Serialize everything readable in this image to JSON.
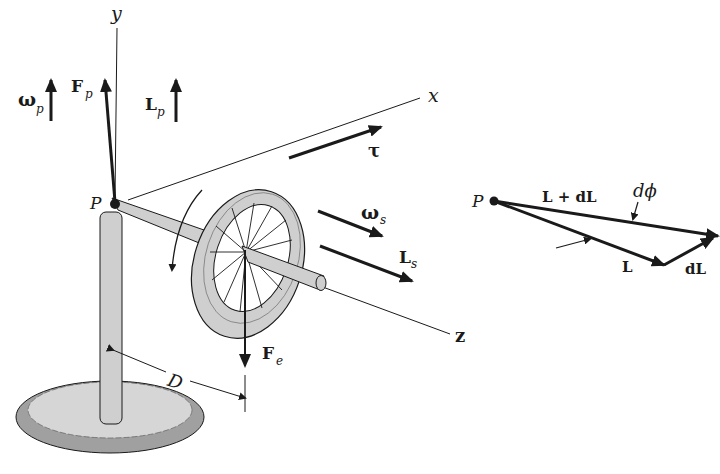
{
  "diagram": {
    "colors": {
      "ink": "#1a1a1a",
      "metal": "#cfcfcf",
      "base_rim": "#a0a0a0",
      "base_top": "#d6d6d6"
    },
    "axes": {
      "y": "y",
      "x": "x",
      "z": "z"
    },
    "left_labels": {
      "pivot": "P",
      "omega_p": "ω",
      "omega_p_sub": "p",
      "F_p": "F",
      "F_p_sub": "p",
      "L_p": "L",
      "L_p_sub": "p",
      "tau": "τ",
      "omega_s": "ω",
      "omega_s_sub": "s",
      "L_s": "L",
      "L_s_sub": "s",
      "F_e": "F",
      "F_e_sub": "e",
      "D": "D"
    },
    "right_labels": {
      "pivot": "P",
      "L_plus_dL": "L + dL",
      "d_phi": "dϕ",
      "L": "L",
      "dL": "dL"
    }
  }
}
